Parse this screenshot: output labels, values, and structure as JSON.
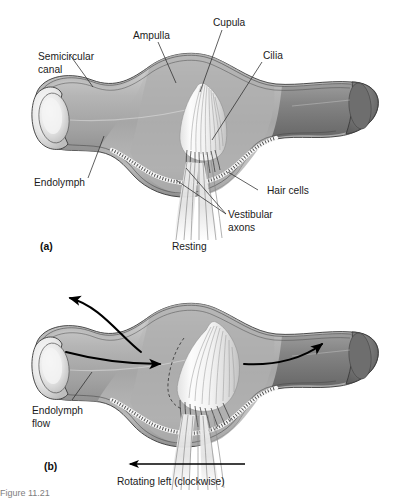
{
  "figure": {
    "background_color": "#ffffff",
    "ink_color": "#1b1b1b",
    "cropped_caption": "Figure 11.21"
  },
  "panel_a": {
    "panel_label": "(a)",
    "state_caption": "Resting",
    "labels": [
      {
        "id": "semicircular-canal",
        "text_line1": "Semicircular",
        "text_line2": "canal"
      },
      {
        "id": "ampulla",
        "text_line1": "Ampulla",
        "text_line2": ""
      },
      {
        "id": "cupula",
        "text_line1": "Cupula",
        "text_line2": ""
      },
      {
        "id": "cilia",
        "text_line1": "Cilia",
        "text_line2": ""
      },
      {
        "id": "endolymph",
        "text_line1": "Endolymph",
        "text_line2": ""
      },
      {
        "id": "hair-cells",
        "text_line1": "Hair cells",
        "text_line2": ""
      },
      {
        "id": "vestibular-axons",
        "text_line1": "Vestibular",
        "text_line2": "axons"
      }
    ]
  },
  "panel_b": {
    "panel_label": "(b)",
    "state_caption": "Rotating left (clockwise)",
    "labels": [
      {
        "id": "endolymph-flow",
        "text_line1": "Endolymph",
        "text_line2": "flow"
      }
    ],
    "flow_arrows": [
      {
        "id": "upper-left-arrow",
        "direction": "left"
      },
      {
        "id": "mid-left-arrow",
        "direction": "right"
      },
      {
        "id": "mid-right-arrow",
        "direction": "right"
      }
    ],
    "rotation_arrow": {
      "id": "rotation-arrow",
      "direction": "left"
    }
  },
  "colors": {
    "canal_fill_light": "#cfcfcf",
    "canal_fill_mid": "#a9a9a9",
    "canal_fill_dark": "#7d7d7d",
    "canal_fill_darkest": "#6a6a6a",
    "highlight": "#f2f2f2",
    "outline": "#3a3a3a",
    "cupula_fill": "#fbfbfb",
    "axon_fill": "#e9e9e9"
  }
}
